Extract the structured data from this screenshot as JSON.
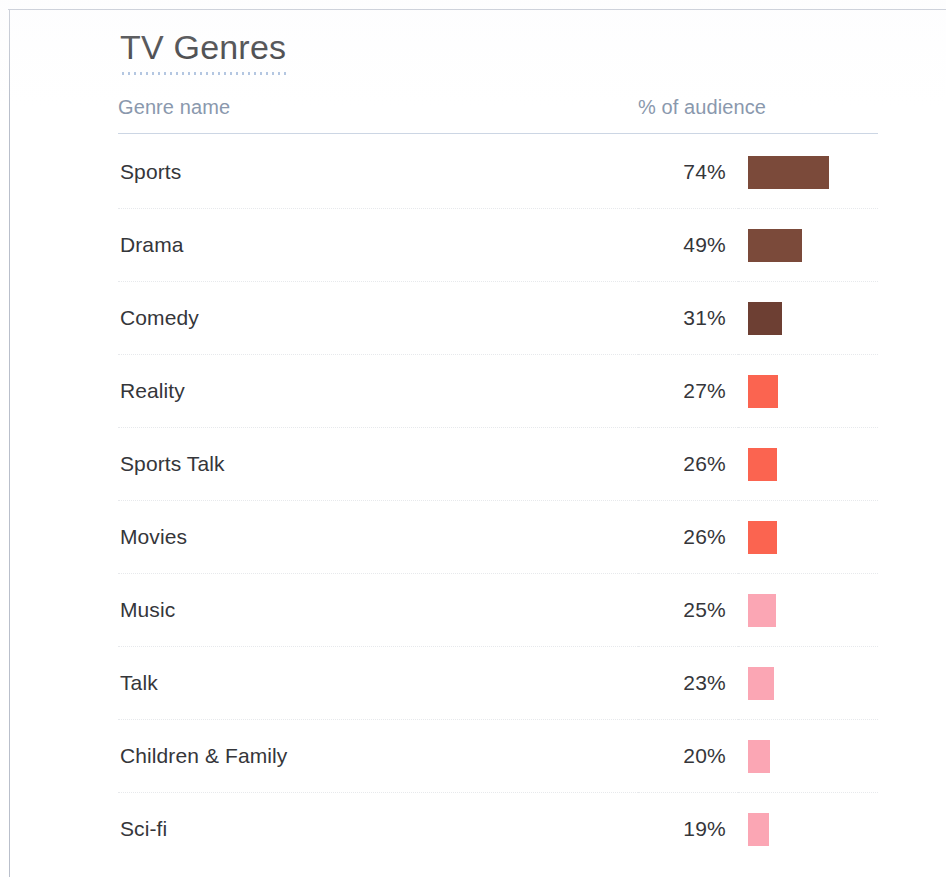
{
  "page": {
    "title": "TV Genres",
    "accent_dotted_rule_color": "#9db6d8",
    "header_rule_color": "#ccd6e4",
    "text_color": "#35363a",
    "header_text_color": "#8a98ad"
  },
  "table": {
    "columns": [
      {
        "key": "name",
        "label": "Genre name",
        "align": "left"
      },
      {
        "key": "pct",
        "label": "% of audience",
        "align": "right"
      },
      {
        "key": "bar",
        "label": "",
        "align": "left"
      }
    ],
    "rows": [
      {
        "name": "Sports",
        "pct": "74%",
        "value": 74,
        "bar_color": "#7b4a3a",
        "bar_width_px": 81
      },
      {
        "name": "Drama",
        "pct": "49%",
        "value": 49,
        "bar_color": "#7b4a3a",
        "bar_width_px": 54
      },
      {
        "name": "Comedy",
        "pct": "31%",
        "value": 31,
        "bar_color": "#6d3f33",
        "bar_width_px": 34
      },
      {
        "name": "Reality",
        "pct": "27%",
        "value": 27,
        "bar_color": "#fb6450",
        "bar_width_px": 30
      },
      {
        "name": "Sports Talk",
        "pct": "26%",
        "value": 26,
        "bar_color": "#fb6450",
        "bar_width_px": 29
      },
      {
        "name": "Movies",
        "pct": "26%",
        "value": 26,
        "bar_color": "#fb6450",
        "bar_width_px": 29
      },
      {
        "name": "Music",
        "pct": "25%",
        "value": 25,
        "bar_color": "#fba6b4",
        "bar_width_px": 28
      },
      {
        "name": "Talk",
        "pct": "23%",
        "value": 23,
        "bar_color": "#fba6b4",
        "bar_width_px": 26
      },
      {
        "name": "Children & Family",
        "pct": "20%",
        "value": 20,
        "bar_color": "#fba6b4",
        "bar_width_px": 22
      },
      {
        "name": "Sci-fi",
        "pct": "19%",
        "value": 19,
        "bar_color": "#fba6b4",
        "bar_width_px": 21
      }
    ]
  },
  "chart_data": {
    "type": "bar",
    "title": "TV Genres",
    "xlabel": "% of audience",
    "ylabel": "Genre name",
    "orientation": "horizontal",
    "grid": false,
    "legend": null,
    "value_suffix": "%",
    "xlim": [
      0,
      74
    ],
    "categories": [
      "Sports",
      "Drama",
      "Comedy",
      "Reality",
      "Sports Talk",
      "Movies",
      "Music",
      "Talk",
      "Children & Family",
      "Sci-fi"
    ],
    "values": [
      74,
      49,
      31,
      27,
      26,
      26,
      25,
      23,
      20,
      19
    ],
    "bar_colors": [
      "#7b4a3a",
      "#7b4a3a",
      "#6d3f33",
      "#fb6450",
      "#fb6450",
      "#fb6450",
      "#fba6b4",
      "#fba6b4",
      "#fba6b4",
      "#fba6b4"
    ],
    "data_labels": [
      "74%",
      "49%",
      "31%",
      "27%",
      "26%",
      "26%",
      "25%",
      "23%",
      "20%",
      "19%"
    ]
  }
}
